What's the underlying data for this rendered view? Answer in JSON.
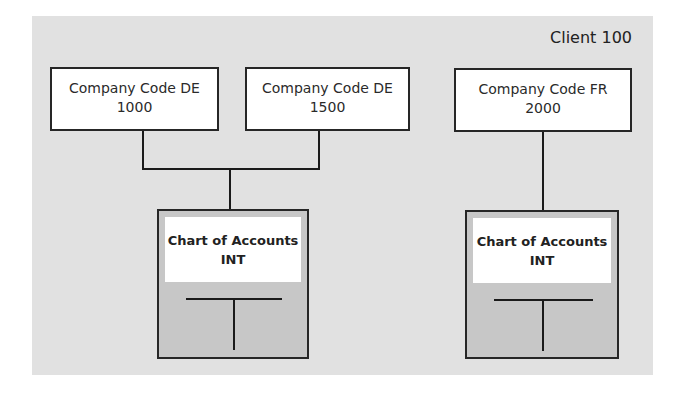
{
  "diagram": {
    "client_label": "Client 100",
    "company_codes": [
      {
        "line1": "Company Code DE",
        "line2": "1000"
      },
      {
        "line1": "Company Code DE",
        "line2": "1500"
      },
      {
        "line1": "Company Code FR",
        "line2": "2000"
      }
    ],
    "charts_of_accounts": [
      {
        "line1": "Chart of Accounts",
        "line2": "INT",
        "icon": "t-account-icon"
      },
      {
        "line1": "Chart of Accounts",
        "line2": "INT",
        "icon": "t-account-icon"
      }
    ],
    "colors": {
      "panel_background": "#e1e1e1",
      "box_fill": "#ffffff",
      "chart_fill": "#c7c7c7",
      "line": "#1a1a1a"
    }
  }
}
